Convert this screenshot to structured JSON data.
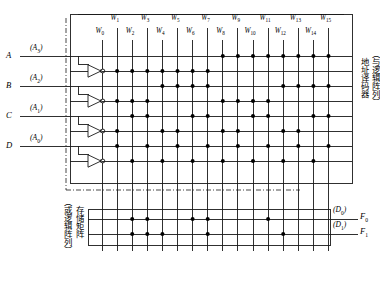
{
  "diagram": {
    "inputs": [
      {
        "name": "A",
        "alias": "A3",
        "sub": "3"
      },
      {
        "name": "B",
        "alias": "A2",
        "sub": "2"
      },
      {
        "name": "C",
        "alias": "A1",
        "sub": "1"
      },
      {
        "name": "D",
        "alias": "A0",
        "sub": "0"
      }
    ],
    "word_lines": [
      "W0",
      "W1",
      "W2",
      "W3",
      "W4",
      "W5",
      "W6",
      "W7",
      "W8",
      "W9",
      "W10",
      "W11",
      "W12",
      "W13",
      "W14",
      "W15"
    ],
    "word_line_subs": [
      "0",
      "1",
      "2",
      "3",
      "4",
      "5",
      "6",
      "7",
      "8",
      "9",
      "10",
      "11",
      "12",
      "13",
      "14",
      "15"
    ],
    "outputs": [
      {
        "name": "F",
        "sub": "0",
        "alias": "D",
        "alias_sub": "0"
      },
      {
        "name": "F",
        "sub": "1",
        "alias": "D",
        "alias_sub": "1"
      }
    ],
    "and_array_label": "地址译码器",
    "and_array_note": "（与逻辑阵列）",
    "or_array_label": "存储矩阵",
    "or_array_note": "（或逻辑阵列）",
    "and_rows": [
      {
        "signal": "A3",
        "dots": [
          8,
          9,
          10,
          11,
          12,
          13,
          14,
          15
        ]
      },
      {
        "signal": "A3bar",
        "dots": [
          0,
          1,
          2,
          3,
          4,
          5,
          6,
          7
        ]
      },
      {
        "signal": "A2",
        "dots": [
          4,
          5,
          6,
          7,
          12,
          13,
          14,
          15
        ]
      },
      {
        "signal": "A2bar",
        "dots": [
          0,
          1,
          2,
          3,
          8,
          9,
          10,
          11
        ]
      },
      {
        "signal": "A1",
        "dots": [
          2,
          3,
          6,
          7,
          10,
          11,
          14,
          15
        ]
      },
      {
        "signal": "A1bar",
        "dots": [
          0,
          1,
          4,
          5,
          8,
          9,
          12,
          13
        ]
      },
      {
        "signal": "A0",
        "dots": [
          1,
          3,
          5,
          7,
          9,
          11,
          13,
          15
        ]
      },
      {
        "signal": "A0bar",
        "dots": [
          0,
          2,
          4,
          6,
          8,
          10,
          12,
          14
        ]
      }
    ],
    "or_rows": [
      {
        "signal": "F0",
        "dots": [
          2,
          3,
          6,
          7,
          11
        ]
      },
      {
        "signal": "F1",
        "dots": [
          2,
          3,
          4,
          7,
          12
        ]
      }
    ],
    "colors": {
      "line": "#1a1a1a",
      "dot": "#000000",
      "bg": "#ffffff"
    }
  }
}
